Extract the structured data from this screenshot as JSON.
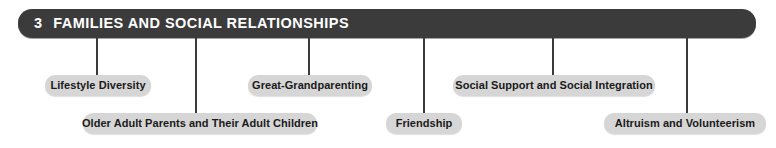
{
  "header": {
    "number": "3",
    "title": "FAMILIES AND SOCIAL RELATIONSHIPS",
    "bar_color": "#3b3b3b",
    "text_color": "#ffffff"
  },
  "nodes": [
    {
      "label": "Lifestyle Diversity"
    },
    {
      "label": "Older Adult Parents and Their Adult Children"
    },
    {
      "label": "Great-Grandparenting"
    },
    {
      "label": "Friendship"
    },
    {
      "label": "Social Support and Social Integration"
    },
    {
      "label": "Altruism and Volunteerism"
    }
  ],
  "style": {
    "node_fill": "#d6d6d6",
    "node_text": "#1a1a1a",
    "connector_color": "#3b3b3b",
    "background": "#ffffff"
  }
}
